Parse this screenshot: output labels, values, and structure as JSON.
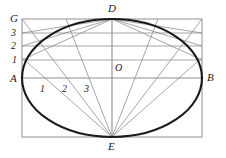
{
  "figure": {
    "type": "geometric-diagram",
    "canvas": {
      "width": 226,
      "height": 158,
      "background": "#ffffff"
    },
    "colors": {
      "ellipse_stroke": "#1a1a1a",
      "rectangle_stroke": "#9a9a9a",
      "construction_line_stroke": "#8f8f8f",
      "axis_stroke": "#8f8f8f",
      "label_color": "#1a1a1a"
    },
    "rectangle": {
      "x": 22,
      "y": 19,
      "width": 180,
      "height": 118
    },
    "ellipse": {
      "cx": 112,
      "cy": 78,
      "rx": 90,
      "ry": 59
    },
    "axes": {
      "horizontal": {
        "x1": 22,
        "y1": 78,
        "x2": 202,
        "y2": 78
      },
      "vertical": {
        "x1": 112,
        "y1": 19,
        "x2": 112,
        "y2": 137
      }
    },
    "points": [
      {
        "name": "A",
        "label": "A",
        "x": 22,
        "y": 78,
        "label_x": 10,
        "label_y": 73
      },
      {
        "name": "B",
        "label": "B",
        "x": 202,
        "y": 78,
        "label_x": 207,
        "label_y": 72
      },
      {
        "name": "D",
        "label": "D",
        "x": 112,
        "y": 19,
        "label_x": 108,
        "label_y": 3
      },
      {
        "name": "E",
        "label": "E",
        "x": 112,
        "y": 137,
        "label_x": 108,
        "label_y": 141
      },
      {
        "name": "O",
        "label": "O",
        "x": 112,
        "y": 78,
        "label_x": 115,
        "label_y": 62
      },
      {
        "name": "G",
        "label": "G",
        "x": 22,
        "y": 19,
        "label_x": 10,
        "label_y": 13
      }
    ],
    "vertical_divisions": {
      "axis": "AG",
      "labels": [
        "3",
        "2",
        "1"
      ],
      "levels_y": [
        33,
        46,
        60
      ],
      "label_x": 11,
      "label_offsets_y": [
        27,
        40,
        54
      ]
    },
    "horizontal_divisions": {
      "axis": "AO",
      "labels": [
        "1",
        "2",
        "3"
      ],
      "points_x": [
        45,
        67,
        89
      ],
      "label_x": [
        40,
        62,
        84
      ],
      "label_y": 83
    },
    "rays_from_E": {
      "origin": {
        "x": 112,
        "y": 137
      },
      "targets_x_on_AB": [
        45,
        67,
        89
      ],
      "extends_to_rectangle_top": true,
      "count_left": 3,
      "count_right": 3,
      "mirrored": true
    },
    "rays_from_D": {
      "origin": {
        "x": 112,
        "y": 19
      },
      "targets_y_on_left_edge": [
        33,
        46,
        60
      ],
      "extends_to_rectangle_right": true,
      "count_left": 3,
      "count_right": 3,
      "mirrored": true
    },
    "horizontal_guides_y": [
      33,
      46,
      60
    ]
  }
}
